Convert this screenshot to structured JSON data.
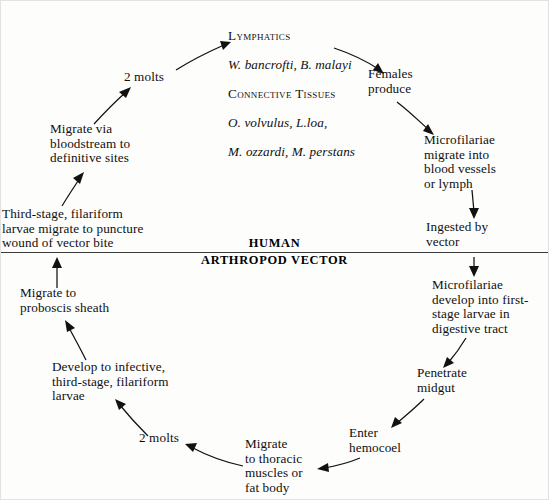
{
  "diagram": {
    "host_divider": {
      "upper_label": "HUMAN",
      "lower_label": "ARTHROPOD VECTOR"
    },
    "nodes": [
      {
        "id": "adult-sites",
        "heading1": "Lymphatics",
        "species1": "W. bancrofti, B. malayi",
        "heading2": "Connective Tissues",
        "species2": "O. volvulus, L.loa,",
        "species3": "M. ozzardi, M. perstans"
      },
      {
        "id": "females-produce",
        "text": "Females\nproduce"
      },
      {
        "id": "microfilariae-migrate",
        "text": "Microfilariae\nmigrate into\nblood vessels\nor lymph"
      },
      {
        "id": "ingested-by-vector",
        "text": "Ingested by\nvector"
      },
      {
        "id": "mf-develop-first-stage",
        "text": "Microfilariae\ndevelop into first-\nstage larvae in\ndigestive tract"
      },
      {
        "id": "penetrate-midgut",
        "text": "Penetrate\nmidgut"
      },
      {
        "id": "enter-hemocoel",
        "text": "Enter\nhemocoel"
      },
      {
        "id": "migrate-thoracic",
        "text": "Migrate\nto thoracic\nmuscles or\nfat body"
      },
      {
        "id": "two-molts-vector",
        "text": "2 molts"
      },
      {
        "id": "develop-infective",
        "text": "Develop to infective,\nthird-stage, filariform\nlarvae"
      },
      {
        "id": "migrate-proboscis",
        "text": "Migrate to\nproboscis sheath"
      },
      {
        "id": "third-stage-puncture",
        "text": "Third-stage, filariform\nlarvae migrate to puncture\nwound of vector bite"
      },
      {
        "id": "migrate-bloodstream",
        "text": "Migrate via\nbloodstream to\ndefinitive sites"
      },
      {
        "id": "two-molts-human",
        "text": "2 molts"
      }
    ]
  }
}
